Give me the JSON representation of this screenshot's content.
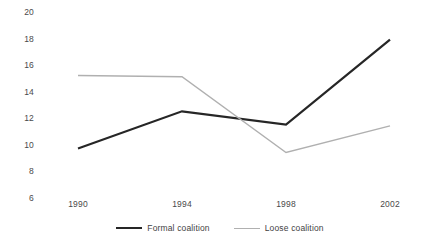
{
  "chart_data": {
    "type": "line",
    "title": "",
    "xlabel": "",
    "ylabel": "",
    "categories": [
      "1990",
      "1994",
      "1998",
      "2002"
    ],
    "x": [
      1990,
      1994,
      1998,
      2002
    ],
    "ylim": [
      6,
      20
    ],
    "yticks": [
      20,
      18,
      16,
      14,
      12,
      10,
      8,
      6
    ],
    "ytick_labels": [
      "20",
      "18",
      "16",
      "14",
      "12",
      "10",
      "8",
      "6"
    ],
    "grid": false,
    "legend_position": "bottom",
    "series": [
      {
        "name": "Formal coalition",
        "color": "#262626",
        "line_width": 2.2,
        "values": [
          9.8,
          12.6,
          11.6,
          18.0
        ]
      },
      {
        "name": "Loose coalition",
        "color": "#b0b0b0",
        "line_width": 1.4,
        "values": [
          15.3,
          15.2,
          9.5,
          11.5
        ]
      }
    ]
  },
  "legend": {
    "items": [
      {
        "label": "Formal coalition"
      },
      {
        "label": "Loose coalition"
      }
    ]
  }
}
